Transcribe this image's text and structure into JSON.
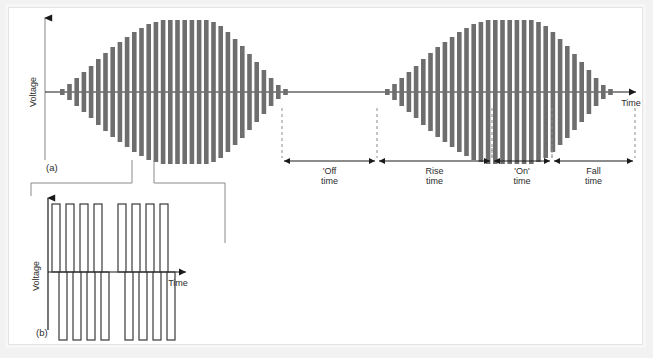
{
  "figure": {
    "panels": [
      {
        "id": "a",
        "label": "(a)",
        "y_axis_label": "Voltage",
        "x_axis_label": "Time"
      },
      {
        "id": "b",
        "label": "(b)",
        "y_axis_label": "Voltage",
        "x_axis_label": "Time"
      }
    ],
    "timing_labels": [
      {
        "name": "off-time",
        "line1": "'Off",
        "line2": "time"
      },
      {
        "name": "rise-time",
        "line1": "Rise",
        "line2": "time"
      },
      {
        "name": "on-time",
        "line1": "'On'",
        "line2": "time"
      },
      {
        "name": "fall-time",
        "line1": "Fall",
        "line2": "time"
      }
    ],
    "caption": "",
    "colors": {
      "bar": "#6e6e6e",
      "axis": "#1a1a1a",
      "dashed": "#8c8c8c",
      "leader": "#8a8a8a",
      "frame": "#e4e4e4",
      "page": "#f2f2f2",
      "panel": "#ffffff"
    }
  },
  "chart_data": {
    "type": "bar",
    "xlabel": "Time",
    "ylabel": "Voltage",
    "grid": false,
    "legend": null,
    "axis_origin_y": 92,
    "panel_a": {
      "description": "Two identical bursts of bipolar bars whose envelope rises to a flat top then falls; bars are symmetric about the zero (time) axis.",
      "burst_1": {
        "x_start": 60,
        "bar_pitch": 7.2,
        "bar_width": 4.6,
        "amplitudes": [
          3,
          8,
          14,
          20,
          26,
          33,
          39,
          45,
          50,
          55,
          60,
          64,
          68,
          70,
          72,
          72,
          72,
          72,
          72,
          72,
          72,
          70,
          66,
          60,
          53,
          46,
          38,
          30,
          22,
          14,
          7,
          3
        ]
      },
      "burst_2": {
        "x_start": 385,
        "bar_pitch": 7.2,
        "bar_width": 4.6,
        "amplitudes": [
          3,
          8,
          14,
          20,
          26,
          33,
          39,
          45,
          50,
          55,
          60,
          64,
          68,
          70,
          72,
          72,
          72,
          72,
          72,
          72,
          72,
          70,
          66,
          60,
          53,
          46,
          38,
          30,
          22,
          14,
          7,
          3
        ]
      },
      "dim_stops": [
        282,
        377,
        492,
        552,
        635
      ],
      "dim_line_y": 161,
      "dash_top_y": 108,
      "axis": {
        "x_left": 45,
        "x_right": 640,
        "y_top": 16,
        "y_zero": 92
      }
    },
    "panel_b": {
      "description": "Expanded view: two packets of four square pulses each, drawn as hollow outlined rectangles alternating about the zero axis.",
      "axis": {
        "x_left": 48,
        "x_right": 185,
        "y_top": 196,
        "y_zero": 272
      },
      "pulse_group_1_x": [
        52,
        66,
        80,
        94
      ],
      "pulse_group_2_x": [
        118,
        132,
        146,
        160
      ],
      "pulse_width": 8,
      "pulse_up_height": 68,
      "pulse_down_height": 68
    }
  }
}
